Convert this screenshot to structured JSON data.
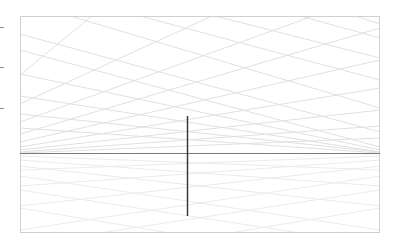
{
  "viewport": {
    "frame": {
      "x": 20,
      "y": 16,
      "width": 360,
      "height": 217,
      "stroke": "#d4d4d4"
    },
    "horizon": {
      "y": 153,
      "x1": 20,
      "x2": 380,
      "stroke": "#7a7a7a"
    },
    "vertical_axis": {
      "x": 187,
      "y1": 116,
      "y2": 216,
      "stroke": "#3a3a3a"
    },
    "grid": {
      "stroke": "#e2e2e2",
      "floor_stroke": "#ececec"
    },
    "left_ticks": [
      27,
      67,
      108
    ],
    "colors": {
      "background": "#ffffff",
      "grid": "#e2e2e2",
      "axis": "#3a3a3a"
    }
  }
}
